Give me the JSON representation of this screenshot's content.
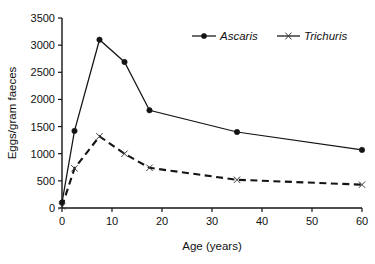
{
  "chart_data": {
    "type": "line",
    "title": "",
    "subtitle": "",
    "xlabel": "Age (years)",
    "ylabel": "Eggs/gram faeces",
    "xlim": [
      0,
      60
    ],
    "ylim": [
      0,
      3500
    ],
    "xticks": [
      0,
      10,
      20,
      30,
      40,
      50,
      60
    ],
    "yticks": [
      0,
      500,
      1000,
      1500,
      2000,
      2500,
      3000,
      3500
    ],
    "xtick_labels": [
      "0",
      "10",
      "20",
      "30",
      "40",
      "50",
      "60"
    ],
    "ytick_labels": [
      "0",
      "500",
      "1000",
      "1500",
      "2000",
      "2500",
      "3000",
      "3500"
    ],
    "grid": false,
    "legend_position": "top-right",
    "series": [
      {
        "name": "Ascaris",
        "style": "solid",
        "marker": "filled-circle",
        "color": "#141414",
        "x": [
          0,
          2.5,
          7.5,
          12.5,
          17.5,
          35,
          60
        ],
        "values": [
          100,
          1420,
          3100,
          2690,
          1800,
          1400,
          1070
        ]
      },
      {
        "name": "Trichuris",
        "style": "dashed",
        "marker": "x",
        "color": "#141414",
        "x": [
          0,
          2.5,
          7.5,
          12.5,
          17.5,
          35,
          60
        ],
        "values": [
          30,
          730,
          1320,
          1000,
          740,
          520,
          430
        ]
      }
    ],
    "annotations": []
  },
  "legend": {
    "entries": [
      {
        "label": "Ascaris"
      },
      {
        "label": "Trichuris"
      }
    ]
  },
  "colors": {
    "ink": "#141414",
    "background": "#ffffff"
  }
}
